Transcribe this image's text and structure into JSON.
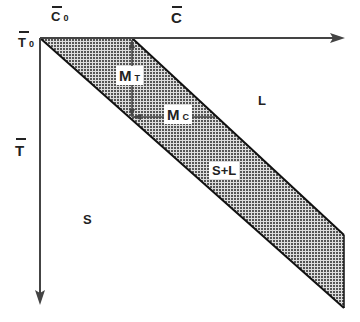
{
  "diagram": {
    "axes": {
      "x_label": "C",
      "x_origin_label": "C",
      "x_origin_sub": "0",
      "y_label": "T",
      "y_origin_label": "T",
      "y_origin_sub": "0"
    },
    "regions": {
      "liquid": "L",
      "solid": "S",
      "mushy": "S+L"
    },
    "annotations": {
      "mt_main": "M",
      "mt_sub": "T",
      "mc_main": "M",
      "mc_sub": "C"
    },
    "colors": {
      "line": "#222222",
      "hatch": "#555555",
      "background": "#ffffff"
    }
  }
}
